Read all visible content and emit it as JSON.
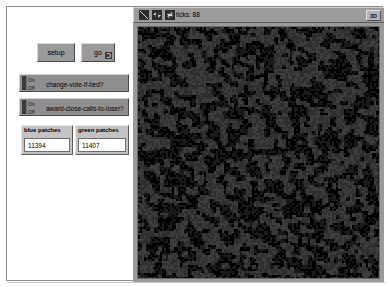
{
  "window": {
    "background_color": "#ffffff",
    "frame_color": "#8c8c8c"
  },
  "control_panel": {
    "buttons": [
      {
        "label": "setup",
        "forever": false,
        "icon": "play-once-icon"
      },
      {
        "label": "go",
        "forever": true,
        "icon": "forever-loop-icon"
      }
    ],
    "switches": [
      {
        "label": "change-vote-if-tied?",
        "on_label": "On",
        "off_label": "Off",
        "value": "Off"
      },
      {
        "label": "award-close-calls-to-loser?",
        "on_label": "On",
        "off_label": "Off",
        "value": "Off"
      }
    ],
    "monitors": [
      {
        "title": "blue patches",
        "value": "11394"
      },
      {
        "title": "green patches",
        "value": "11407"
      }
    ]
  },
  "view": {
    "toolbar": {
      "icons": [
        "resize-view-icon",
        "horizontal-arrows-icon",
        "vertical-arrows-icon"
      ],
      "ticks_label": "ticks: 88",
      "three_d_label": "3D"
    },
    "canvas": {
      "background_color": "#0d0d0d",
      "patch_colors": [
        "#1a1a1a",
        "#2e2e2e",
        "#3d3d3d",
        "#000000"
      ],
      "description": "noisy two-color patch world rendered in grayscale"
    }
  }
}
